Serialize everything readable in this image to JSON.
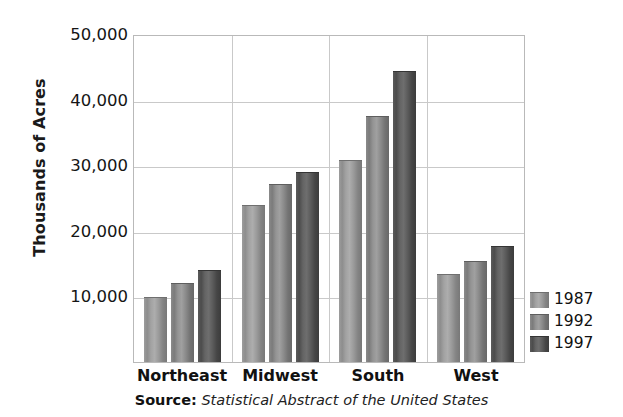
{
  "chart_data": {
    "type": "bar",
    "title": "",
    "xlabel": "",
    "ylabel": "Thousands of Acres",
    "categories": [
      "Northeast",
      "Midwest",
      "South",
      "West"
    ],
    "series": [
      {
        "name": "1987",
        "color": "#8f8f8f",
        "values": [
          9700,
          23800,
          30700,
          13300
        ]
      },
      {
        "name": "1992",
        "color": "#7f7f7f",
        "values": [
          11900,
          27000,
          37400,
          15200
        ]
      },
      {
        "name": "1997",
        "color": "#4f4f4f",
        "values": [
          13900,
          28800,
          44200,
          17600
        ]
      }
    ],
    "ylim": [
      0,
      50000
    ],
    "yticks": [
      10000,
      20000,
      30000,
      40000,
      50000
    ],
    "ytick_labels": [
      "10,000",
      "20,000",
      "30,000",
      "40,000",
      "50,000"
    ],
    "grid": true,
    "legend_position": "right-bottom-outside"
  },
  "axes": {
    "y_title": "Thousands of Acres"
  },
  "legend": {
    "entries": [
      {
        "label": "1987"
      },
      {
        "label": "1992"
      },
      {
        "label": "1997"
      }
    ]
  },
  "source": {
    "prefix": "Source:",
    "text": "Statistical Abstract of the United States"
  }
}
